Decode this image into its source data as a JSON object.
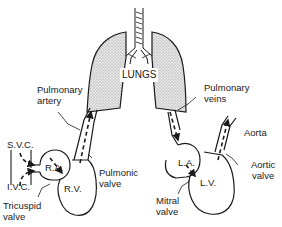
{
  "diagram": {
    "colors": {
      "stroke": "#1a1a1a",
      "lung_fill": "#d9d9d9",
      "background": "#ffffff"
    },
    "labels": {
      "lungs": "LUNGS",
      "pulmonary_artery_line1": "Pulmonary",
      "pulmonary_artery_line2": "artery",
      "pulmonary_veins_line1": "Pulmonary",
      "pulmonary_veins_line2": "veins",
      "svc": "S.V.C.",
      "ivc": "I.V.C.",
      "ra": "R.A.",
      "rv": "R.V.",
      "pulmonic_valve_line1": "Pulmonic",
      "pulmonic_valve_line2": "valve",
      "tricuspid_valve_line1": "Tricuspid",
      "tricuspid_valve_line2": "valve",
      "la": "L.A.",
      "lv": "L.V.",
      "aorta": "Aorta",
      "aortic_valve_line1": "Aortic",
      "aortic_valve_line2": "valve",
      "mitral_valve_line1": "Mitral",
      "mitral_valve_line2": "valve"
    }
  }
}
